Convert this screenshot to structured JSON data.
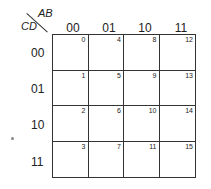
{
  "kmap": {
    "col_var": "AB",
    "row_var": "CD",
    "col_headers": [
      "00",
      "01",
      "10",
      "11"
    ],
    "row_headers": [
      "00",
      "01",
      "10",
      "11"
    ],
    "cells": [
      [
        "0",
        "4",
        "8",
        "12"
      ],
      [
        "1",
        "5",
        "9",
        "13"
      ],
      [
        "2",
        "6",
        "10",
        "14"
      ],
      [
        "3",
        "7",
        "11",
        "15"
      ]
    ]
  }
}
